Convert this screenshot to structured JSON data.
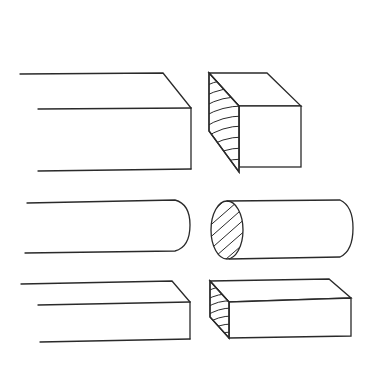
{
  "diagram": {
    "type": "technical-illustration",
    "rows": [
      {
        "name": "square-timber",
        "long_view": "rectangular bar with beveled top-right corner",
        "end_view": "square block with hatched end-grain face"
      },
      {
        "name": "round-dowel",
        "long_view": "cylinder with rounded right end",
        "end_view": "short cylinder with hatched elliptical end-grain face"
      },
      {
        "name": "flat-board",
        "long_view": "flat plank with beveled top-right corner",
        "end_view": "flat block with hatched end-grain face"
      }
    ],
    "colors": {
      "stroke": "#2a2a2a",
      "background": "#ffffff"
    }
  }
}
